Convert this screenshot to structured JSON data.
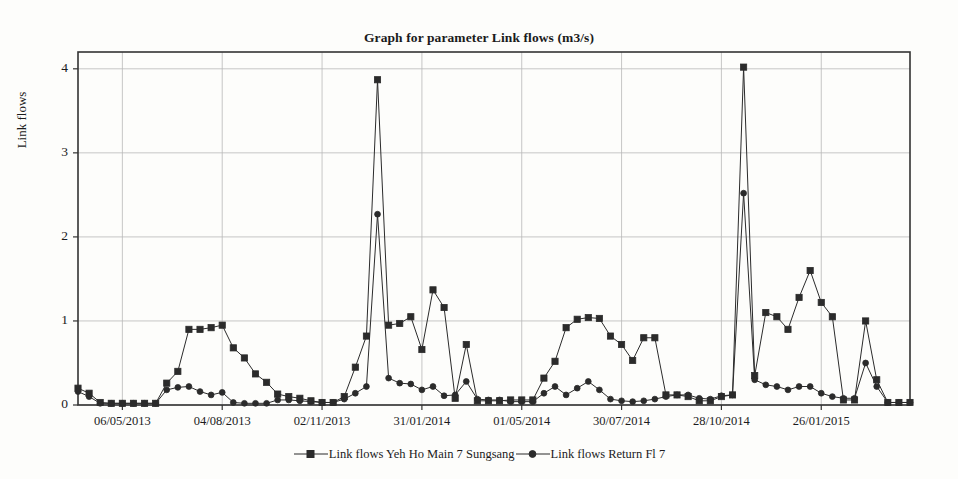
{
  "chart_data": {
    "type": "line",
    "title": "Graph for parameter Link flows (m3/s)",
    "xlabel": "",
    "ylabel": "Link flows",
    "ylim": [
      0,
      4.2
    ],
    "yticks": [
      0,
      1,
      2,
      3,
      4
    ],
    "grid": true,
    "legend_position": "bottom",
    "xtick_labels": [
      "06/05/2013",
      "04/08/2013",
      "02/11/2013",
      "31/01/2014",
      "01/05/2014",
      "30/07/2014",
      "28/10/2014",
      "26/01/2015"
    ],
    "xtick_indices": [
      4,
      13,
      22,
      31,
      40,
      49,
      58,
      67
    ],
    "x_count": 76,
    "series": [
      {
        "name": "Link flows Yeh Ho Main 7 Sungsang",
        "marker": "square",
        "color": "#2b2b2b",
        "values": [
          0.2,
          0.14,
          0.03,
          0.02,
          0.02,
          0.02,
          0.02,
          0.02,
          0.26,
          0.4,
          0.9,
          0.9,
          0.92,
          0.95,
          0.68,
          0.56,
          0.37,
          0.27,
          0.13,
          0.1,
          0.08,
          0.05,
          0.03,
          0.03,
          0.1,
          0.45,
          0.82,
          3.87,
          0.95,
          0.97,
          1.05,
          0.66,
          1.37,
          1.16,
          0.08,
          0.72,
          0.05,
          0.05,
          0.05,
          0.06,
          0.06,
          0.06,
          0.32,
          0.52,
          0.92,
          1.02,
          1.04,
          1.03,
          0.82,
          0.72,
          0.53,
          0.8,
          0.8,
          0.12,
          0.12,
          0.1,
          0.05,
          0.05,
          0.1,
          0.12,
          4.02,
          0.35,
          1.1,
          1.05,
          0.9,
          1.28,
          1.6,
          1.22,
          1.05,
          0.06,
          0.06,
          1.0,
          0.3,
          0.03,
          0.03,
          0.03
        ]
      },
      {
        "name": "Link flows Return Fl 7",
        "marker": "circle",
        "color": "#2b2b2b",
        "values": [
          0.16,
          0.1,
          0.02,
          0.02,
          0.02,
          0.02,
          0.02,
          0.02,
          0.18,
          0.21,
          0.22,
          0.16,
          0.12,
          0.15,
          0.03,
          0.02,
          0.02,
          0.02,
          0.06,
          0.06,
          0.05,
          0.04,
          0.03,
          0.03,
          0.07,
          0.14,
          0.22,
          2.27,
          0.32,
          0.26,
          0.25,
          0.18,
          0.22,
          0.11,
          0.12,
          0.28,
          0.07,
          0.06,
          0.06,
          0.04,
          0.04,
          0.04,
          0.14,
          0.22,
          0.12,
          0.2,
          0.28,
          0.18,
          0.07,
          0.05,
          0.04,
          0.05,
          0.07,
          0.1,
          0.12,
          0.12,
          0.08,
          0.07,
          0.11,
          0.12,
          2.52,
          0.3,
          0.24,
          0.22,
          0.18,
          0.22,
          0.22,
          0.14,
          0.1,
          0.08,
          0.08,
          0.5,
          0.22,
          0.03,
          0.03,
          0.03
        ]
      }
    ]
  },
  "legend": {
    "entries": [
      {
        "label": "Link flows Yeh Ho Main 7 Sungsang"
      },
      {
        "label": "Link flows Return Fl 7"
      }
    ]
  }
}
